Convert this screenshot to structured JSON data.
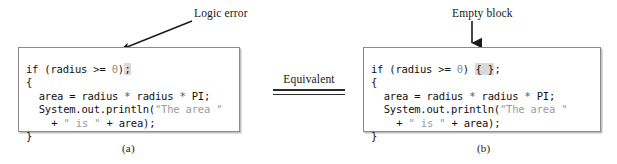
{
  "figure": {
    "caption_a": "(a)",
    "caption_b": "(b)",
    "equivalence_label": "Equivalent"
  },
  "annotations": {
    "logic_error": {
      "label": "Logic error",
      "arrow": "diagonal-arrow-down-left",
      "points_to": "trailing-semicolon"
    },
    "empty_block": {
      "label": "Empty block",
      "arrow": "vertical-arrow-down",
      "points_to": "empty-braces"
    }
  },
  "panel_a": {
    "name": "code-block-a",
    "lines": [
      {
        "id": "a-l1",
        "indent": 0,
        "segments": [
          {
            "text": "if (radius >= ",
            "cls": "code"
          },
          {
            "text": "0",
            "cls": "num"
          },
          {
            "text": ")",
            "cls": "code"
          },
          {
            "text": ";",
            "cls": "hl"
          }
        ]
      },
      {
        "id": "a-l2",
        "indent": 0,
        "segments": [
          {
            "text": "{",
            "cls": "code"
          }
        ]
      },
      {
        "id": "a-l3",
        "indent": 1,
        "segments": [
          {
            "text": "area = radius ",
            "cls": "code"
          },
          {
            "text": "*",
            "cls": "op-star"
          },
          {
            "text": " radius ",
            "cls": "code"
          },
          {
            "text": "*",
            "cls": "op-star"
          },
          {
            "text": " PI;",
            "cls": "code"
          }
        ]
      },
      {
        "id": "a-l4",
        "indent": 1,
        "segments": [
          {
            "text": "System.out.println(",
            "cls": "code"
          },
          {
            "text": "\"The area \"",
            "cls": "str"
          }
        ]
      },
      {
        "id": "a-l5",
        "indent": 2,
        "segments": [
          {
            "text": "+ ",
            "cls": "code"
          },
          {
            "text": "\" is \"",
            "cls": "str"
          },
          {
            "text": " + area);",
            "cls": "code"
          }
        ]
      },
      {
        "id": "a-l6",
        "indent": 0,
        "segments": [
          {
            "text": "}",
            "cls": "code"
          }
        ]
      }
    ]
  },
  "panel_b": {
    "name": "code-block-b",
    "lines": [
      {
        "id": "b-l1",
        "indent": 0,
        "segments": [
          {
            "text": "if (radius >= ",
            "cls": "code"
          },
          {
            "text": "0",
            "cls": "num"
          },
          {
            "text": ") ",
            "cls": "code"
          },
          {
            "text": "{ }",
            "cls": "hl"
          },
          {
            "text": ";",
            "cls": "code"
          }
        ]
      },
      {
        "id": "b-l2",
        "indent": 0,
        "segments": [
          {
            "text": "{",
            "cls": "code"
          }
        ]
      },
      {
        "id": "b-l3",
        "indent": 1,
        "segments": [
          {
            "text": "area = radius ",
            "cls": "code"
          },
          {
            "text": "*",
            "cls": "op-star"
          },
          {
            "text": " radius ",
            "cls": "code"
          },
          {
            "text": "*",
            "cls": "op-star"
          },
          {
            "text": " PI;",
            "cls": "code"
          }
        ]
      },
      {
        "id": "b-l4",
        "indent": 1,
        "segments": [
          {
            "text": "System.out.println(",
            "cls": "code"
          },
          {
            "text": "\"The area \"",
            "cls": "str"
          }
        ]
      },
      {
        "id": "b-l5",
        "indent": 2,
        "segments": [
          {
            "text": "+ ",
            "cls": "code"
          },
          {
            "text": "\" is \"",
            "cls": "str"
          },
          {
            "text": " + area);",
            "cls": "code"
          }
        ]
      },
      {
        "id": "b-l6",
        "indent": 0,
        "segments": [
          {
            "text": "}",
            "cls": "code"
          }
        ]
      }
    ]
  },
  "colors": {
    "page_background": "#ffffff",
    "code_text": "#111111",
    "string_literal": "#9a9a9a",
    "highlight": "#d9d9d9",
    "panel_border": "#8a8a8a",
    "arrow": "#1a1a1a"
  }
}
